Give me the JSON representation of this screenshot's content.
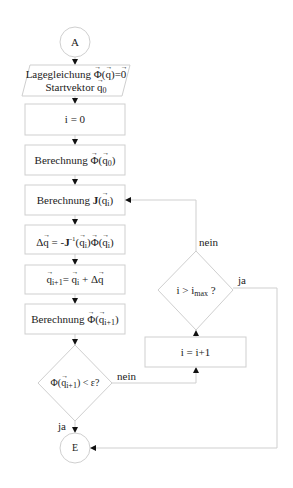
{
  "flowchart": {
    "start": {
      "label": "A"
    },
    "input": {
      "line1": "Lagegleichung Φ(q)=0",
      "line2": "Startvektor q₀"
    },
    "steps": [
      {
        "id": "init",
        "label": "i = 0"
      },
      {
        "id": "phi0",
        "label": "Berechnung Φ(q₀)"
      },
      {
        "id": "jac",
        "label": "Berechnung J(qᵢ)"
      },
      {
        "id": "delta",
        "label": "Δq = -J⁻¹(qᵢ)Φ(qᵢ)"
      },
      {
        "id": "update",
        "label": "qᵢ₊₁ = qᵢ + Δq"
      },
      {
        "id": "phi_next",
        "label": "Berechnung Φ(qᵢ₊₁)"
      }
    ],
    "decision_converge": {
      "label": "Φ(qᵢ₊₁) < ε?",
      "yes": "ja",
      "no": "nein"
    },
    "increment": {
      "label": "i = i+1"
    },
    "decision_max": {
      "label": "i > imax ?",
      "yes": "ja",
      "no": "nein"
    },
    "end": {
      "label": "E"
    }
  },
  "text": {
    "start": "A",
    "end": "E",
    "lage": "Lagegleichung",
    "start_vec": "Startvektor",
    "init": "i = 0",
    "berechnung": "Berechnung",
    "incr": "i = i+1",
    "ja": "ja",
    "nein": "nein"
  }
}
